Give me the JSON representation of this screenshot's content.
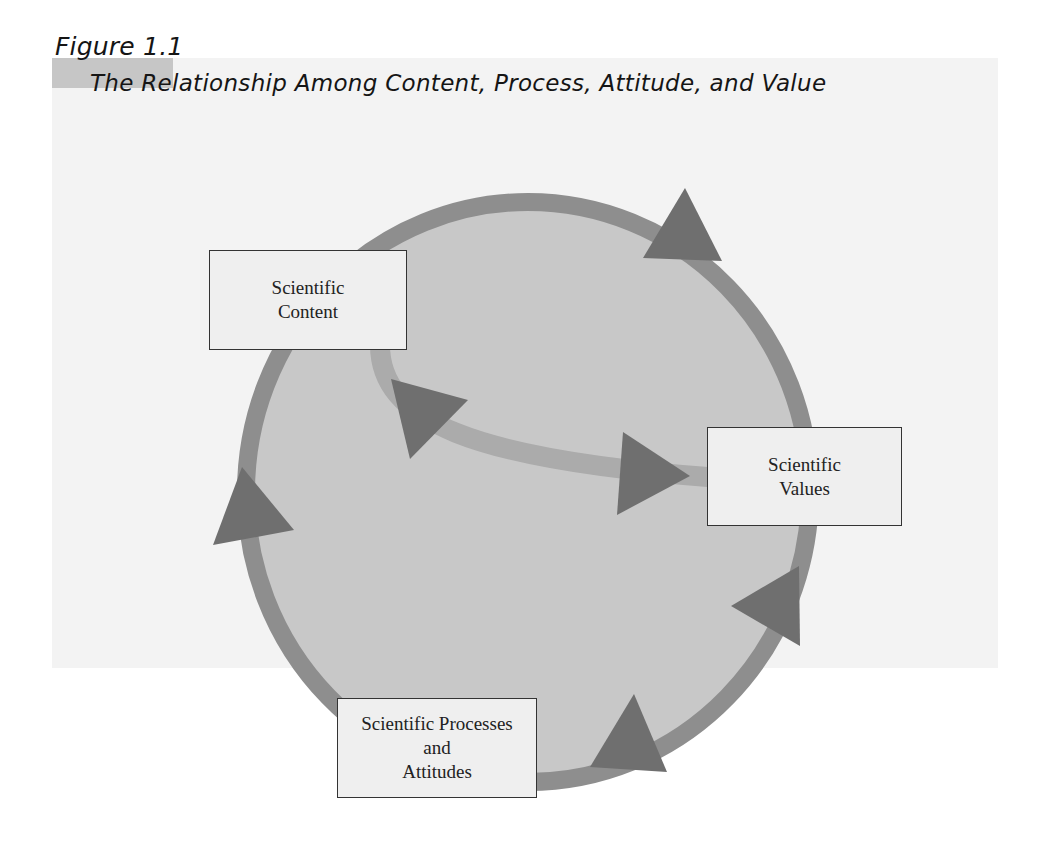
{
  "figure": {
    "label": "Figure 1.1",
    "title": "The Relationship Among Content, Process, Attitude, and Value"
  },
  "nodes": {
    "content": {
      "line1": "Scientific",
      "line2": "Content"
    },
    "values": {
      "line1": "Scientific",
      "line2": "Values"
    },
    "processes": {
      "line1": "Scientific Processes",
      "line2": "and",
      "line3": "Attitudes"
    }
  },
  "colors": {
    "panel_bg": "#f3f3f3",
    "figure_label_bg": "#c6c6c6",
    "circle_fill": "#c8c8c8",
    "ring_stroke": "#8e8e8e",
    "inner_arc": "#ababab",
    "arrowhead": "#6f6f6f",
    "box_fill": "#efefef",
    "box_border": "#333333"
  }
}
